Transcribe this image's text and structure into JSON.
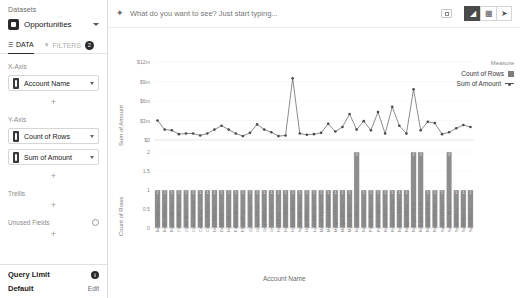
{
  "sidebar": {
    "datasets_label": "Datasets",
    "dataset_name": "Opportunities",
    "tabs": [
      {
        "label": "DATA",
        "icon": "list-icon",
        "active": true
      },
      {
        "label": "FILTERS",
        "icon": "funnel-icon",
        "active": false
      }
    ],
    "filters_badge": "2",
    "x_axis": {
      "title": "X-Axis",
      "fields": [
        "Account Name"
      ]
    },
    "y_axis": {
      "title": "Y-Axis",
      "fields": [
        "Count of Rows",
        "Sum of Amount"
      ]
    },
    "trellis": {
      "title": "Trellis"
    },
    "unused_fields": {
      "title": "Unused Fields"
    },
    "add_label": "+",
    "footer": {
      "query_limit_label": "Query Limit",
      "query_limit_badge": "i",
      "default_label": "Default",
      "edit_label": "Edit"
    }
  },
  "topbar": {
    "search_placeholder": "What do you want to see? Just start typing...",
    "sparkle_icon": "sparkle-icon",
    "expand_icon": "expand-icon",
    "view_buttons": [
      {
        "name": "chart-view",
        "glyph": "◢",
        "active": true
      },
      {
        "name": "table-view",
        "glyph": "▦",
        "active": false
      },
      {
        "name": "pivot-view",
        "glyph": "➤",
        "active": false
      }
    ]
  },
  "legend": {
    "title": "Measure",
    "items": [
      {
        "label": "Count of Rows",
        "marker": "bar",
        "color": "#7d7d7d"
      },
      {
        "label": "Sum of Amount",
        "marker": "line",
        "color": "#555555"
      }
    ]
  },
  "chart_data": {
    "type": "line",
    "title": "",
    "xlabel": "Account Name",
    "panels": [
      {
        "id": "sum-of-amount-panel",
        "type": "line",
        "ylabel": "Sum of Amount",
        "yticks": [
          "$12m",
          "$9m",
          "$6m",
          "$3m",
          "$0"
        ],
        "ylim": [
          0,
          12
        ],
        "series_name": "Sum of Amount",
        "values": [
          3.0,
          1.6,
          1.5,
          0.9,
          1.0,
          1.0,
          0.7,
          1.0,
          1.6,
          2.2,
          1.6,
          1.0,
          0.6,
          1.1,
          2.4,
          1.6,
          1.2,
          0.6,
          0.7,
          9.5,
          1.0,
          0.8,
          0.9,
          1.1,
          2.5,
          1.3,
          2.0,
          4.0,
          1.6,
          2.9,
          1.5,
          4.3,
          1.0,
          5.1,
          2.2,
          1.0,
          7.8,
          1.5,
          2.8,
          2.6,
          0.9,
          1.2,
          1.8,
          2.3,
          2.0
        ]
      },
      {
        "id": "count-of-rows-panel",
        "type": "bar",
        "ylabel": "Count of Rows",
        "yticks": [
          "2",
          "1.5",
          "1",
          "0.5",
          "0"
        ],
        "ylim": [
          0,
          2
        ],
        "series_name": "Count of Rows",
        "values": [
          1,
          1,
          1,
          1,
          1,
          1,
          1,
          1,
          1,
          1,
          1,
          1,
          1,
          1,
          1,
          1,
          1,
          1,
          1,
          1,
          1,
          1,
          1,
          1,
          1,
          1,
          1,
          1,
          2,
          1,
          1,
          1,
          1,
          1,
          1,
          1,
          2,
          2,
          1,
          1,
          1,
          2,
          1,
          1,
          1
        ]
      }
    ],
    "categories": [
      "Becker PBS Inc",
      "Brewer PBS Inc",
      "Bryant HSB Inc",
      "Carlson TAC Inc",
      "Clarke BB Inc",
      "Coleman RRS Inc",
      "Cook BB Inc",
      "Cooper SQL Inc",
      "Dean RRD Inc",
      "Doyle RRD Inc",
      "Doyle BB Inc",
      "Edwards BB Inc",
      "Elliott TP Inc",
      "Graves HT Inc",
      "Grayson PS Inc",
      "Gray RRS Inc",
      "Green RRD Inc",
      "Hall BB Inc",
      "Harper HSB Inc",
      "Henderson BB Inc",
      "Ingram RRD Inc",
      "Lloyd RRD Inc",
      "Lowe RRD Inc",
      "Marshal TQ Inc",
      "MacDonald RRD Inc",
      "Marquez HT Inc",
      "Morgan PBS Inc",
      "Murphy BB Inc",
      "Nichols RRD Inc",
      "Norris HT Inc",
      "Palmer BB Inc",
      "Pittman HSB Inc",
      "Ramirez BT Inc",
      "Richardson TT Inc",
      "Robinson RRD Inc",
      "Rodgers BB Inc",
      "Rodriguez BB Inc",
      "Rodriguez HT Inc",
      "Rodriquez HT Inc",
      "Russell RRD Inc",
      "Sanders LT Inc",
      "Sanchez BB Inc",
      "Scott PBS Inc",
      "Scott RRD Inc",
      "Scott TRD Inc"
    ]
  }
}
